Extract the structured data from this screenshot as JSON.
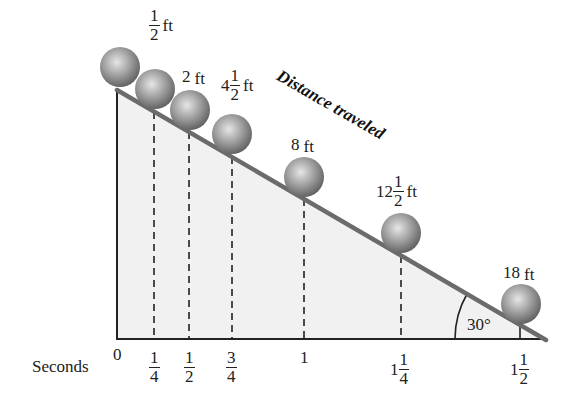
{
  "title": "Distance traveled",
  "axis": {
    "label": "Seconds",
    "ticks": [
      {
        "whole": "0",
        "num": "",
        "den": ""
      },
      {
        "whole": "",
        "num": "1",
        "den": "4"
      },
      {
        "whole": "",
        "num": "1",
        "den": "2"
      },
      {
        "whole": "",
        "num": "3",
        "den": "4"
      },
      {
        "whole": "1",
        "num": "",
        "den": ""
      },
      {
        "whole": "1",
        "num": "1",
        "den": "4"
      },
      {
        "whole": "1",
        "num": "1",
        "den": "2"
      }
    ]
  },
  "distances": [
    {
      "whole": "",
      "num": "1",
      "den": "2",
      "unit": "ft"
    },
    {
      "whole": "2",
      "num": "",
      "den": "",
      "unit": "ft"
    },
    {
      "whole": "4",
      "num": "1",
      "den": "2",
      "unit": "ft"
    },
    {
      "whole": "8",
      "num": "",
      "den": "",
      "unit": "ft"
    },
    {
      "whole": "12",
      "num": "1",
      "den": "2",
      "unit": "ft"
    },
    {
      "whole": "18",
      "num": "",
      "den": "",
      "unit": "ft"
    }
  ],
  "angle": "30°",
  "colors": {
    "incline": "#6b6b6b",
    "fill": "#f1f1f1",
    "ball_light": "#d8d8d8",
    "ball_dark": "#6a6a6a",
    "axis": "#222222"
  }
}
